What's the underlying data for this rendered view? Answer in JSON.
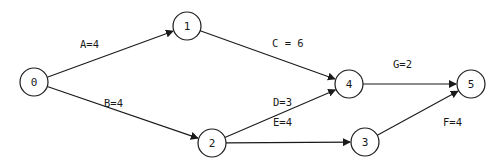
{
  "diagram": {
    "type": "activity-on-arrow network",
    "nodes": [
      {
        "id": "0",
        "label": "0",
        "cx": 34,
        "cy": 82
      },
      {
        "id": "1",
        "label": "1",
        "cx": 187,
        "cy": 26
      },
      {
        "id": "2",
        "label": "2",
        "cx": 212,
        "cy": 143
      },
      {
        "id": "3",
        "label": "3",
        "cx": 365,
        "cy": 142
      },
      {
        "id": "4",
        "label": "4",
        "cx": 349,
        "cy": 84
      },
      {
        "id": "5",
        "label": "5",
        "cx": 471,
        "cy": 84
      }
    ],
    "edges": [
      {
        "activity": "A",
        "duration": 4,
        "from": "0",
        "to": "1",
        "label": "A=4",
        "lx": 80,
        "ly": 48
      },
      {
        "activity": "B",
        "duration": 4,
        "from": "0",
        "to": "2",
        "label": "B=4",
        "lx": 104,
        "ly": 107
      },
      {
        "activity": "C",
        "duration": 6,
        "from": "1",
        "to": "4",
        "label": "C = 6",
        "lx": 272,
        "ly": 47
      },
      {
        "activity": "D",
        "duration": 3,
        "from": "2",
        "to": "4",
        "label": "D=3",
        "lx": 273,
        "ly": 106
      },
      {
        "activity": "E",
        "duration": 4,
        "from": "2",
        "to": "3",
        "label": "E=4",
        "lx": 273,
        "ly": 126
      },
      {
        "activity": "G",
        "duration": 2,
        "from": "4",
        "to": "5",
        "label": "G=2",
        "lx": 393,
        "ly": 68
      },
      {
        "activity": "F",
        "duration": 4,
        "from": "3",
        "to": "5",
        "label": "F=4",
        "lx": 443,
        "ly": 126
      }
    ],
    "node_radius": 14,
    "stroke_color": "#1a1a1a",
    "background": "#ffffff"
  }
}
